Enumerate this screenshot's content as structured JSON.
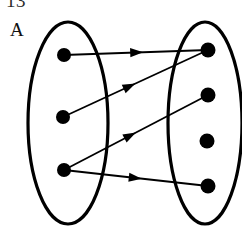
{
  "figure": {
    "kind": "set-mapping-diagram",
    "width": 242,
    "height": 228,
    "background_color": "#ffffff",
    "stroke_color": "#000000",
    "clipped_header_text": "13",
    "set_a_label": "A",
    "set_b_label": ""
  },
  "ellipses": [
    {
      "name": "left-set-ellipse",
      "label": "A",
      "cx": 68,
      "cy": 123,
      "rx": 40,
      "ry": 101,
      "stroke_width": 3.2
    },
    {
      "name": "right-set-ellipse",
      "label": "",
      "cx": 205,
      "cy": 123,
      "rx": 37,
      "ry": 101,
      "stroke_width": 3.2
    }
  ],
  "nodes": {
    "left": [
      {
        "id": "a1",
        "cx": 64,
        "cy": 55,
        "r": 7
      },
      {
        "id": "a2",
        "cx": 63,
        "cy": 117,
        "r": 7
      },
      {
        "id": "a3",
        "cx": 64,
        "cy": 170,
        "r": 7
      }
    ],
    "right": [
      {
        "id": "b1",
        "cx": 208,
        "cy": 50,
        "r": 7.5
      },
      {
        "id": "b2",
        "cx": 208,
        "cy": 95,
        "r": 7.5
      },
      {
        "id": "b3",
        "cx": 207,
        "cy": 141,
        "r": 7.5
      },
      {
        "id": "b4",
        "cx": 208,
        "cy": 186,
        "r": 7.5
      }
    ]
  },
  "arrows": [
    {
      "id": "arrow-a1-b1",
      "from": "a1",
      "to": "b1",
      "x1": 64,
      "y1": 55,
      "x2": 208,
      "y2": 50,
      "arrowhead_t": 0.55,
      "stroke_width": 1.8
    },
    {
      "id": "arrow-a2-b1",
      "from": "a2",
      "to": "b1",
      "x1": 63,
      "y1": 117,
      "x2": 208,
      "y2": 50,
      "arrowhead_t": 0.5,
      "stroke_width": 1.8
    },
    {
      "id": "arrow-a3-b2",
      "from": "a3",
      "to": "b2",
      "x1": 64,
      "y1": 170,
      "x2": 208,
      "y2": 95,
      "arrowhead_t": 0.5,
      "stroke_width": 1.8
    },
    {
      "id": "arrow-a3-b4",
      "from": "a3",
      "to": "b4",
      "x1": 64,
      "y1": 170,
      "x2": 208,
      "y2": 186,
      "arrowhead_t": 0.54,
      "stroke_width": 1.8
    }
  ],
  "unmapped_nodes": [
    "b3"
  ]
}
